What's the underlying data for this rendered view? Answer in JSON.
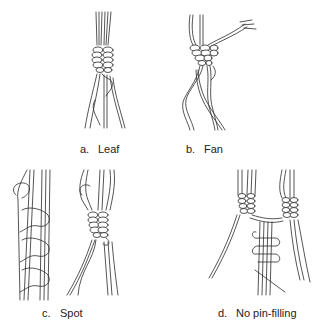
{
  "figure": {
    "panels": [
      {
        "id": "a",
        "letter": "a.",
        "label": "Leaf"
      },
      {
        "id": "b",
        "letter": "b.",
        "label": "Fan"
      },
      {
        "id": "c",
        "letter": "c.",
        "label": "Spot"
      },
      {
        "id": "d",
        "letter": "d.",
        "label": "No pin-filling"
      }
    ]
  }
}
